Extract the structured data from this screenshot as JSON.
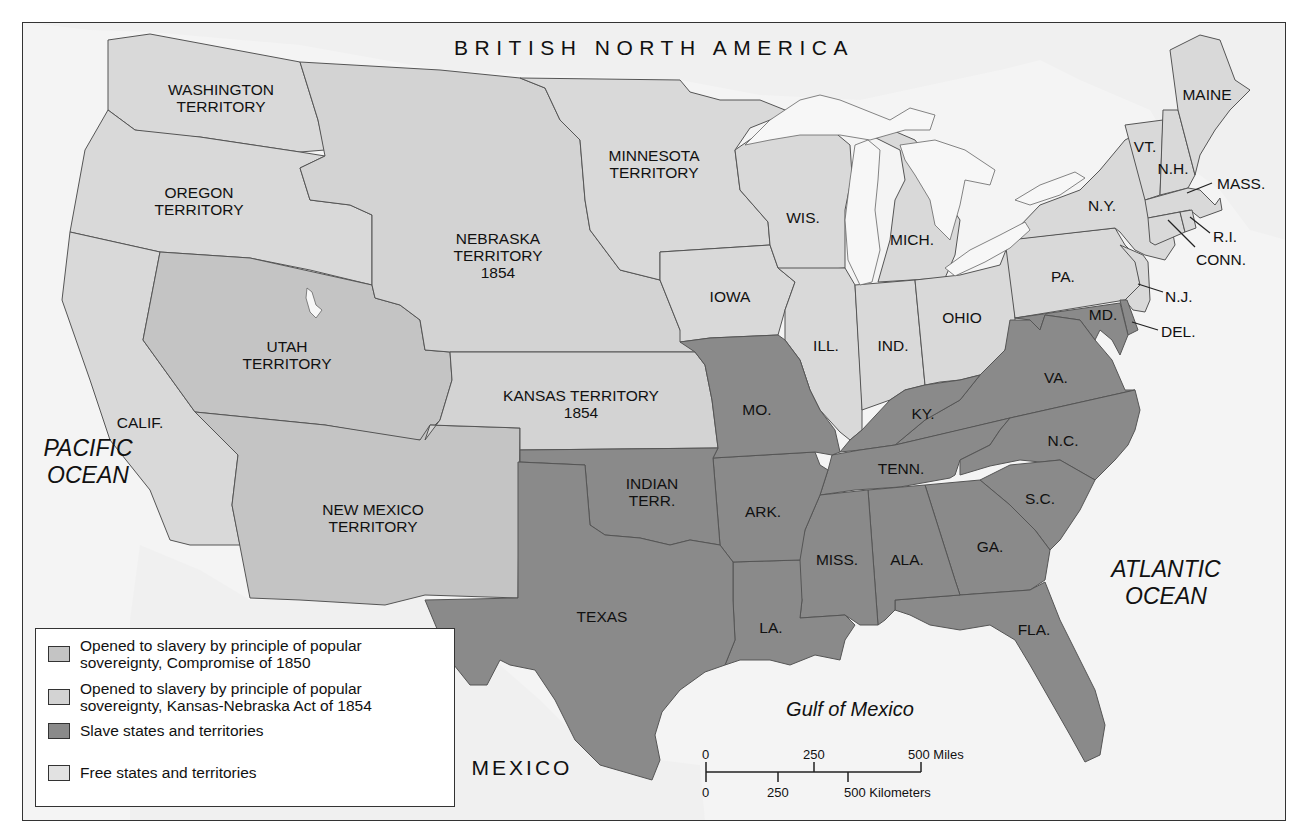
{
  "map": {
    "title_region": "BRITISH NORTH AMERICA",
    "colors": {
      "ocean": "#f4f4f4",
      "foreign_land": "#f0f0f0",
      "free": "#d9d9d9",
      "kansas_nebraska": "#d3d3d3",
      "compromise_1850": "#c4c4c4",
      "slave": "#8a8a8a",
      "border": "#555555",
      "lakes": "#f7f7f7"
    },
    "countries": [
      {
        "id": "mexico",
        "label": "MEXICO"
      }
    ],
    "water": [
      {
        "id": "pacific",
        "label": "PACIFIC\nOCEAN"
      },
      {
        "id": "atlantic",
        "label": "ATLANTIC\nOCEAN"
      },
      {
        "id": "gulf",
        "label": "Gulf of Mexico"
      }
    ],
    "regions": [
      {
        "id": "washington",
        "label": "WASHINGTON\nTERRITORY",
        "status": "free"
      },
      {
        "id": "oregon",
        "label": "OREGON\nTERRITORY",
        "status": "free"
      },
      {
        "id": "california",
        "label": "CALIF.",
        "status": "free"
      },
      {
        "id": "utah",
        "label": "UTAH\nTERRITORY",
        "status": "compromise_1850"
      },
      {
        "id": "new_mexico",
        "label": "NEW MEXICO\nTERRITORY",
        "status": "compromise_1850"
      },
      {
        "id": "nebraska",
        "label": "NEBRASKA\nTERRITORY\n1854",
        "status": "kansas_nebraska"
      },
      {
        "id": "kansas",
        "label": "KANSAS TERRITORY\n1854",
        "status": "kansas_nebraska"
      },
      {
        "id": "minnesota",
        "label": "MINNESOTA\nTERRITORY",
        "status": "free"
      },
      {
        "id": "iowa",
        "label": "IOWA",
        "status": "free"
      },
      {
        "id": "wisconsin",
        "label": "WIS.",
        "status": "free"
      },
      {
        "id": "michigan",
        "label": "MICH.",
        "status": "free"
      },
      {
        "id": "illinois",
        "label": "ILL.",
        "status": "free"
      },
      {
        "id": "indiana",
        "label": "IND.",
        "status": "free"
      },
      {
        "id": "ohio",
        "label": "OHIO",
        "status": "free"
      },
      {
        "id": "pennsylvania",
        "label": "PA.",
        "status": "free"
      },
      {
        "id": "new_york",
        "label": "N.Y.",
        "status": "free"
      },
      {
        "id": "vermont",
        "label": "VT.",
        "status": "free"
      },
      {
        "id": "new_hampshire",
        "label": "N.H.",
        "status": "free"
      },
      {
        "id": "maine",
        "label": "MAINE",
        "status": "free"
      },
      {
        "id": "massachusetts",
        "label": "MASS.",
        "status": "free"
      },
      {
        "id": "rhode_island",
        "label": "R.I.",
        "status": "free"
      },
      {
        "id": "connecticut",
        "label": "CONN.",
        "status": "free"
      },
      {
        "id": "new_jersey",
        "label": "N.J.",
        "status": "free"
      },
      {
        "id": "delaware",
        "label": "DEL.",
        "status": "slave"
      },
      {
        "id": "maryland",
        "label": "MD.",
        "status": "slave"
      },
      {
        "id": "virginia",
        "label": "VA.",
        "status": "slave"
      },
      {
        "id": "north_carolina",
        "label": "N.C.",
        "status": "slave"
      },
      {
        "id": "south_carolina",
        "label": "S.C.",
        "status": "slave"
      },
      {
        "id": "georgia",
        "label": "GA.",
        "status": "slave"
      },
      {
        "id": "florida",
        "label": "FLA.",
        "status": "slave"
      },
      {
        "id": "alabama",
        "label": "ALA.",
        "status": "slave"
      },
      {
        "id": "mississippi",
        "label": "MISS.",
        "status": "slave"
      },
      {
        "id": "louisiana",
        "label": "LA.",
        "status": "slave"
      },
      {
        "id": "tennessee",
        "label": "TENN.",
        "status": "slave"
      },
      {
        "id": "kentucky",
        "label": "KY.",
        "status": "slave"
      },
      {
        "id": "missouri",
        "label": "MO.",
        "status": "slave"
      },
      {
        "id": "arkansas",
        "label": "ARK.",
        "status": "slave"
      },
      {
        "id": "indian_territory",
        "label": "INDIAN\nTERR.",
        "status": "slave"
      },
      {
        "id": "texas",
        "label": "TEXAS",
        "status": "slave"
      }
    ]
  },
  "legend": {
    "items": [
      {
        "key": "compromise_1850",
        "label": "Opened to slavery by principle of popular\nsovereignty, Compromise of 1850"
      },
      {
        "key": "kansas_nebraska",
        "label": "Opened to slavery by principle of popular\nsovereignty, Kansas-Nebraska Act of 1854"
      },
      {
        "key": "slave",
        "label": "Slave states and territories"
      },
      {
        "key": "free",
        "label": "Free states and territories"
      }
    ]
  },
  "scale_bar": {
    "miles": {
      "ticks": [
        "0",
        "250",
        "500 Miles"
      ]
    },
    "kilometers": {
      "ticks": [
        "0",
        "250",
        "500 Kilometers"
      ]
    }
  }
}
